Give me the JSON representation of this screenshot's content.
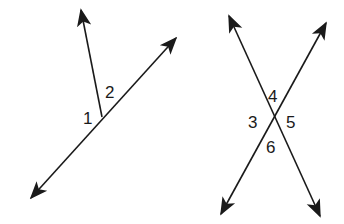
{
  "figures": [
    {
      "name": "adjacent-angles",
      "description": "A line with a ray originating from a point on it",
      "angle_labels": [
        {
          "id": "angle-1",
          "text": "1"
        },
        {
          "id": "angle-2",
          "text": "2"
        }
      ]
    },
    {
      "name": "intersecting-lines",
      "description": "Two intersecting lines forming four angles",
      "angle_labels": [
        {
          "id": "angle-3",
          "text": "3"
        },
        {
          "id": "angle-4",
          "text": "4"
        },
        {
          "id": "angle-5",
          "text": "5"
        },
        {
          "id": "angle-6",
          "text": "6"
        }
      ]
    }
  ],
  "colors": {
    "stroke": "#1a1a1a",
    "background": "#ffffff"
  }
}
